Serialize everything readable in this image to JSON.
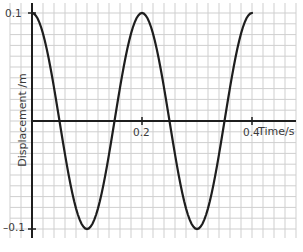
{
  "chart_data": {
    "type": "line",
    "title": "",
    "xlabel": "Time/s",
    "ylabel": "Displacement /m",
    "xlim": [
      0,
      0.4
    ],
    "ylim": [
      -0.1,
      0.1
    ],
    "x_ticks": [
      0.2,
      0.4
    ],
    "x_tick_labels": [
      "0.2",
      "0.4"
    ],
    "y_ticks": [
      0.1,
      -0.1
    ],
    "y_tick_labels": [
      "0.1",
      "–0.1"
    ],
    "grid": true,
    "grid_minor_x": 0.02,
    "grid_minor_y": 0.01,
    "legend": null,
    "series": [
      {
        "name": "displacement",
        "x": [
          0,
          0.02,
          0.04,
          0.06,
          0.08,
          0.1,
          0.12,
          0.14,
          0.16,
          0.18,
          0.2,
          0.22,
          0.24,
          0.26,
          0.28,
          0.3,
          0.32,
          0.34,
          0.36,
          0.38,
          0.4
        ],
        "values": [
          0.1,
          0.0951,
          0.0809,
          0.0588,
          0.0309,
          0.0,
          -0.0309,
          -0.0588,
          -0.0809,
          -0.0951,
          -0.1,
          -0.0951,
          -0.0809,
          -0.0588,
          -0.0309,
          0.0,
          0.0309,
          0.0588,
          0.0809,
          0.0951,
          0.1
        ]
      }
    ],
    "colors": {
      "curve": "#1e1e1e",
      "axes": "#1e1e1e",
      "grid": "#cfcfcf"
    }
  }
}
